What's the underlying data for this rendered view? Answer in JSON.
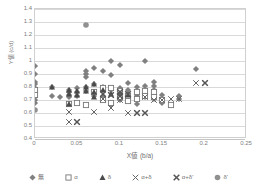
{
  "chart_data": {
    "type": "scatter",
    "title": "",
    "xlabel": "X値 (b/a)",
    "ylabel": "Y値 (c/d)",
    "xlim": [
      0,
      0.25
    ],
    "ylim": [
      0.4,
      1.4
    ],
    "xticks": [
      "0",
      "0.05",
      "0.1",
      "0.15",
      "0.2",
      "0.25"
    ],
    "xtick_values": [
      0,
      0.05,
      0.1,
      0.15,
      0.2,
      0.25
    ],
    "yticks": [
      "0.4",
      "0.5",
      "0.6",
      "0.7",
      "0.8",
      "0.9",
      "1",
      "1.1",
      "1.2",
      "1.3",
      "1.4"
    ],
    "ytick_values": [
      0.4,
      0.5,
      0.6,
      0.7,
      0.8,
      0.9,
      1.0,
      1.1,
      1.2,
      1.3,
      1.4
    ],
    "grid": "horizontal",
    "legend_position": "bottom",
    "series": [
      {
        "name": "無",
        "marker": "diamond-filled",
        "color": "#808080",
        "points": [
          [
            0.0,
            0.96
          ],
          [
            0.0,
            0.9
          ],
          [
            0.0,
            0.84
          ],
          [
            0.0,
            0.82
          ],
          [
            0.0,
            0.79
          ],
          [
            0.0,
            0.77
          ],
          [
            0.0,
            0.74
          ],
          [
            0.0,
            0.72
          ],
          [
            0.0,
            0.7
          ],
          [
            0.0,
            0.68
          ],
          [
            0.02,
            0.8
          ],
          [
            0.02,
            0.73
          ],
          [
            0.03,
            0.72
          ],
          [
            0.04,
            0.78
          ],
          [
            0.04,
            0.76
          ],
          [
            0.04,
            0.74
          ],
          [
            0.04,
            0.72
          ],
          [
            0.05,
            0.79
          ],
          [
            0.05,
            0.76
          ],
          [
            0.05,
            0.73
          ],
          [
            0.06,
            0.92
          ],
          [
            0.06,
            0.9
          ],
          [
            0.06,
            0.88
          ],
          [
            0.06,
            0.8
          ],
          [
            0.06,
            0.77
          ],
          [
            0.07,
            0.95
          ],
          [
            0.07,
            0.82
          ],
          [
            0.07,
            0.73
          ],
          [
            0.08,
            0.92
          ],
          [
            0.08,
            0.8
          ],
          [
            0.08,
            0.72
          ],
          [
            0.09,
            1.0
          ],
          [
            0.09,
            0.89
          ],
          [
            0.09,
            0.78
          ],
          [
            0.09,
            0.66
          ],
          [
            0.1,
            0.97
          ],
          [
            0.1,
            0.79
          ],
          [
            0.1,
            0.7
          ],
          [
            0.11,
            0.83
          ],
          [
            0.11,
            0.78
          ],
          [
            0.11,
            0.75
          ],
          [
            0.11,
            0.72
          ],
          [
            0.12,
            0.8
          ],
          [
            0.12,
            0.76
          ],
          [
            0.12,
            0.73
          ],
          [
            0.12,
            0.67
          ],
          [
            0.13,
            1.0
          ],
          [
            0.13,
            0.81
          ],
          [
            0.13,
            0.76
          ],
          [
            0.13,
            0.72
          ],
          [
            0.14,
            0.84
          ],
          [
            0.14,
            0.81
          ],
          [
            0.14,
            0.78
          ],
          [
            0.14,
            0.71
          ],
          [
            0.15,
            0.74
          ],
          [
            0.15,
            0.71
          ],
          [
            0.15,
            0.68
          ],
          [
            0.17,
            0.73
          ],
          [
            0.17,
            0.71
          ],
          [
            0.19,
            0.94
          ]
        ]
      },
      {
        "name": "α",
        "marker": "square-open",
        "color": "#777777",
        "points": [
          [
            0.0,
            0.78
          ],
          [
            0.0,
            0.74
          ],
          [
            0.04,
            0.67
          ],
          [
            0.05,
            0.68
          ],
          [
            0.06,
            0.66
          ],
          [
            0.07,
            0.76
          ],
          [
            0.08,
            0.79
          ],
          [
            0.08,
            0.7
          ],
          [
            0.09,
            0.79
          ],
          [
            0.09,
            0.68
          ],
          [
            0.1,
            0.77
          ],
          [
            0.1,
            0.72
          ],
          [
            0.11,
            0.73
          ],
          [
            0.11,
            0.69
          ],
          [
            0.12,
            0.76
          ],
          [
            0.12,
            0.71
          ],
          [
            0.13,
            0.77
          ],
          [
            0.13,
            0.73
          ],
          [
            0.14,
            0.76
          ],
          [
            0.14,
            0.72
          ],
          [
            0.15,
            0.7
          ],
          [
            0.16,
            0.66
          ]
        ]
      },
      {
        "name": "δ",
        "marker": "triangle-filled",
        "color": "#4a4a4a",
        "points": [
          [
            0.02,
            0.8
          ],
          [
            0.04,
            0.78
          ],
          [
            0.04,
            0.75
          ],
          [
            0.04,
            0.67
          ],
          [
            0.05,
            0.77
          ],
          [
            0.05,
            0.74
          ],
          [
            0.06,
            0.8
          ],
          [
            0.06,
            0.77
          ],
          [
            0.07,
            0.82
          ],
          [
            0.07,
            0.76
          ],
          [
            0.07,
            0.72
          ],
          [
            0.08,
            0.78
          ],
          [
            0.09,
            0.75
          ],
          [
            0.11,
            0.74
          ]
        ]
      },
      {
        "name": "α+δ",
        "marker": "cross-x",
        "color": "#666666",
        "points": [
          [
            0.04,
            0.61
          ],
          [
            0.04,
            0.53
          ],
          [
            0.05,
            0.53
          ],
          [
            0.07,
            0.61
          ],
          [
            0.08,
            0.75
          ],
          [
            0.08,
            0.71
          ],
          [
            0.09,
            0.74
          ],
          [
            0.09,
            0.64
          ],
          [
            0.1,
            0.75
          ],
          [
            0.1,
            0.7
          ],
          [
            0.11,
            0.6
          ],
          [
            0.12,
            0.6
          ],
          [
            0.13,
            0.72
          ],
          [
            0.14,
            0.7
          ],
          [
            0.15,
            0.7
          ],
          [
            0.16,
            0.71
          ],
          [
            0.17,
            0.71
          ],
          [
            0.19,
            0.83
          ],
          [
            0.2,
            0.83
          ]
        ]
      },
      {
        "name": "α+δ'",
        "marker": "cross-x-bold",
        "color": "#555555",
        "points": [
          [
            0.05,
            0.53
          ],
          [
            0.08,
            0.75
          ],
          [
            0.09,
            0.74
          ],
          [
            0.1,
            0.76
          ],
          [
            0.1,
            0.73
          ],
          [
            0.11,
            0.75
          ],
          [
            0.12,
            0.6
          ],
          [
            0.13,
            0.6
          ],
          [
            0.2,
            0.83
          ]
        ]
      },
      {
        "name": "δ'",
        "marker": "circle-filled",
        "color": "#909090",
        "points": [
          [
            0.0,
            0.62
          ],
          [
            0.06,
            1.28
          ]
        ]
      }
    ]
  },
  "legend": {
    "items": [
      {
        "label": "無",
        "marker": "diamond-filled"
      },
      {
        "label": "α",
        "marker": "square-open"
      },
      {
        "label": "δ",
        "marker": "triangle-filled"
      },
      {
        "label": "α+δ",
        "marker": "cross-x"
      },
      {
        "label": "α+δ'",
        "marker": "cross-x-bold"
      },
      {
        "label": "δ'",
        "marker": "circle-filled"
      }
    ]
  },
  "colors": {
    "gridline": "#d9d9d9",
    "plot_border": "#d0d0d0",
    "text": "#808080"
  }
}
